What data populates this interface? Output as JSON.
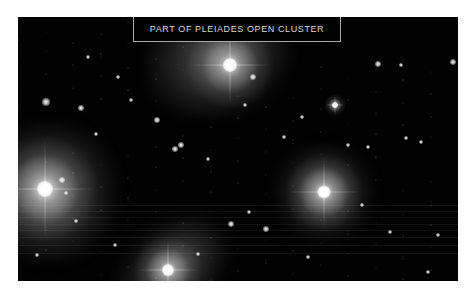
{
  "caption": {
    "text": "PART OF PLEIADES OPEN CLUSTER"
  },
  "photo": {
    "subject": "Pleiades open cluster",
    "background_color": "#020202",
    "bright_stars": [
      {
        "name": "bright-star-top",
        "x": 212,
        "y": 48,
        "core": 14,
        "glow": 90
      },
      {
        "name": "bright-star-left",
        "x": 27,
        "y": 172,
        "core": 16,
        "glow": 110
      },
      {
        "name": "bright-star-right",
        "x": 306,
        "y": 175,
        "core": 13,
        "glow": 80
      },
      {
        "name": "bright-star-bottom",
        "x": 150,
        "y": 253,
        "core": 12,
        "glow": 70
      },
      {
        "name": "bright-star-mid-right",
        "x": 317,
        "y": 88,
        "core": 6,
        "glow": 22
      }
    ],
    "small_stars": [
      [
        28,
        85,
        4
      ],
      [
        63,
        91,
        3
      ],
      [
        139,
        103,
        3
      ],
      [
        157,
        132,
        3
      ],
      [
        163,
        128,
        3
      ],
      [
        78,
        117,
        2
      ],
      [
        44,
        163,
        3
      ],
      [
        48,
        176,
        2
      ],
      [
        113,
        83,
        2
      ],
      [
        235,
        60,
        3
      ],
      [
        227,
        88,
        2
      ],
      [
        284,
        100,
        2
      ],
      [
        360,
        47,
        3
      ],
      [
        435,
        45,
        3
      ],
      [
        383,
        48,
        2
      ],
      [
        266,
        120,
        2
      ],
      [
        190,
        142,
        2
      ],
      [
        213,
        207,
        3
      ],
      [
        248,
        212,
        3
      ],
      [
        231,
        195,
        2
      ],
      [
        344,
        188,
        2
      ],
      [
        372,
        215,
        2
      ],
      [
        420,
        218,
        2
      ],
      [
        388,
        121,
        2
      ],
      [
        403,
        125,
        2
      ],
      [
        58,
        204,
        2
      ],
      [
        97,
        228,
        2
      ],
      [
        19,
        238,
        2
      ],
      [
        330,
        128,
        2
      ],
      [
        350,
        130,
        2
      ],
      [
        410,
        255,
        2
      ],
      [
        290,
        240,
        2
      ],
      [
        180,
        237,
        2
      ],
      [
        100,
        60,
        2
      ],
      [
        70,
        40,
        2
      ]
    ]
  }
}
